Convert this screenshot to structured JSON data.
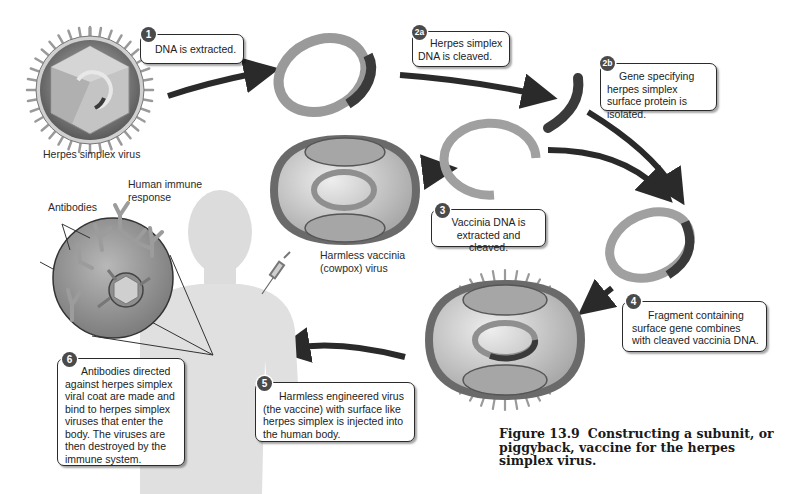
{
  "figure": {
    "number": "Figure 13.9",
    "title": "Constructing a subunit, or piggyback, vaccine for the herpes simplex virus."
  },
  "labels": {
    "herpes_virus": "Herpes simplex virus",
    "vaccinia_virus_line1": "Harmless vaccinia",
    "vaccinia_virus_line2": "(cowpox) virus",
    "antibodies": "Antibodies",
    "immune_line1": "Human immune",
    "immune_line2": "response"
  },
  "steps": [
    {
      "badge": "1",
      "text": "DNA is extracted."
    },
    {
      "badge": "2a",
      "text": "Herpes simplex DNA is cleaved."
    },
    {
      "badge": "2b",
      "text": "Gene specifying herpes simplex surface protein is isolated."
    },
    {
      "badge": "3",
      "text": "Vaccinia DNA is extracted and cleaved."
    },
    {
      "badge": "4",
      "text": "Fragment containing surface gene combines with cleaved vaccinia DNA."
    },
    {
      "badge": "5",
      "text": "Harmless engineered virus (the vaccine) with surface like herpes simplex is injected into the human body."
    },
    {
      "badge": "6",
      "text": "Antibodies directed against herpes simplex viral coat are made and bind to herpes simplex viruses that enter the body. The viruses are then destroyed by the immune system."
    }
  ],
  "colors": {
    "arrow": "#2a2a2a",
    "dna_ring": "#9a9a9a",
    "gene_segment": "#3a3a3a",
    "virus_shell": "#6e6e6e",
    "vaccinia_body": "#c8c8c8",
    "badge_bg": "#4a4a4a"
  }
}
